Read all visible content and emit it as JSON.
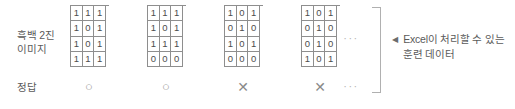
{
  "figure": {
    "background_color": "#ffffff",
    "line_color": "#8e8e8e",
    "text_color": "#5a5a5a",
    "mark_color": "#9a9a9a"
  },
  "rows": {
    "image_label": "흑백 2진\n이미지",
    "answer_label": "정답"
  },
  "samples": [
    {
      "grid": [
        [
          "1",
          "1",
          "1"
        ],
        [
          "1",
          "0",
          "1"
        ],
        [
          "1",
          "0",
          "1"
        ],
        [
          "1",
          "1",
          "1"
        ]
      ],
      "answer": "○"
    },
    {
      "grid": [
        [
          "1",
          "1",
          "1"
        ],
        [
          "1",
          "0",
          "1"
        ],
        [
          "1",
          "1",
          "1"
        ],
        [
          "0",
          "0",
          "0"
        ]
      ],
      "answer": "○"
    },
    {
      "grid": [
        [
          "1",
          "0",
          "1"
        ],
        [
          "0",
          "1",
          "0"
        ],
        [
          "1",
          "0",
          "1"
        ],
        [
          "0",
          "0",
          "0"
        ]
      ],
      "answer": "✕"
    },
    {
      "grid": [
        [
          "1",
          "0",
          "1"
        ],
        [
          "0",
          "1",
          "0"
        ],
        [
          "0",
          "1",
          "0"
        ],
        [
          "1",
          "0",
          "1"
        ]
      ],
      "answer": "✕"
    }
  ],
  "ellipsis": {
    "grids": "···",
    "answers": "···"
  },
  "annotation": {
    "arrow": "◀",
    "text": "Excel이 처리할 수 있는 훈련 데이터"
  }
}
